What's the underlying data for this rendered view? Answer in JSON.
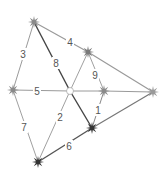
{
  "diagram": {
    "type": "weighted-graph",
    "nodes": [
      {
        "id": "A",
        "x": 34,
        "y": 22,
        "fill": "#8a8a8a",
        "style": "star"
      },
      {
        "id": "B",
        "x": 88,
        "y": 52,
        "fill": "#7a7a7a",
        "style": "star"
      },
      {
        "id": "C",
        "x": 13,
        "y": 90,
        "fill": "#8a8a8a",
        "style": "star"
      },
      {
        "id": "D",
        "x": 70,
        "y": 91,
        "fill": "#ffffff",
        "style": "circle"
      },
      {
        "id": "E",
        "x": 104,
        "y": 91,
        "fill": "#8a8a8a",
        "style": "star"
      },
      {
        "id": "F",
        "x": 153,
        "y": 92,
        "fill": "#9a9a9a",
        "style": "star"
      },
      {
        "id": "G",
        "x": 92,
        "y": 128,
        "fill": "#333333",
        "style": "star"
      },
      {
        "id": "H",
        "x": 38,
        "y": 162,
        "fill": "#333333",
        "style": "star"
      }
    ],
    "edges": [
      {
        "from": "A",
        "to": "C",
        "label": "3",
        "lx": 23,
        "ly": 54,
        "color": "#9a9a9a",
        "width": 1
      },
      {
        "from": "A",
        "to": "B",
        "label": "4",
        "lx": 70,
        "ly": 42,
        "color": "#9a9a9a",
        "width": 1.2
      },
      {
        "from": "B",
        "to": "F",
        "label": "",
        "color": "#9a9a9a",
        "width": 1.2
      },
      {
        "from": "A",
        "to": "D",
        "label": "8",
        "lx": 56,
        "ly": 63,
        "color": "#444444",
        "width": 1.4
      },
      {
        "from": "D",
        "to": "G",
        "label": "",
        "color": "#444444",
        "width": 1.4
      },
      {
        "from": "B",
        "to": "D",
        "label": "",
        "color": "#a0a0a0",
        "width": 1
      },
      {
        "from": "B",
        "to": "E",
        "label": "9",
        "lx": 95,
        "ly": 75,
        "color": "#a0a0a0",
        "width": 1
      },
      {
        "from": "C",
        "to": "D",
        "label": "5",
        "lx": 37,
        "ly": 91,
        "color": "#9a9a9a",
        "width": 1
      },
      {
        "from": "D",
        "to": "E",
        "label": "",
        "color": "#9a9a9a",
        "width": 1
      },
      {
        "from": "E",
        "to": "F",
        "label": "",
        "color": "#9a9a9a",
        "width": 1
      },
      {
        "from": "E",
        "to": "G",
        "label": "1",
        "lx": 98,
        "ly": 110,
        "color": "#888888",
        "width": 1
      },
      {
        "from": "C",
        "to": "H",
        "label": "7",
        "lx": 24,
        "ly": 127,
        "color": "#a0a0a0",
        "width": 1
      },
      {
        "from": "D",
        "to": "H",
        "label": "2",
        "lx": 60,
        "ly": 117,
        "color": "#a0a0a0",
        "width": 1
      },
      {
        "from": "H",
        "to": "G",
        "label": "6",
        "lx": 69,
        "ly": 146,
        "color": "#555555",
        "width": 1.4
      },
      {
        "from": "G",
        "to": "F",
        "label": "",
        "color": "#777777",
        "width": 1.2
      }
    ]
  }
}
